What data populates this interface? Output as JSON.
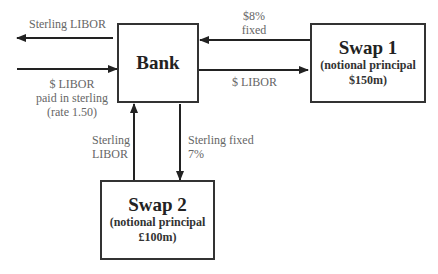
{
  "nodes": {
    "bank": {
      "title": "Bank"
    },
    "swap1": {
      "title": "Swap 1",
      "line1": "(notional principal",
      "line2": "$150m)"
    },
    "swap2": {
      "title": "Swap 2",
      "line1": "(notional principal",
      "line2": "£100m)"
    }
  },
  "edges": {
    "bank_out_left": {
      "line1": "Sterling LIBOR"
    },
    "in_bank_left": {
      "line1": "$ LIBOR",
      "line2": "paid in sterling",
      "line3": "(rate 1.50)"
    },
    "swap1_to_bank": {
      "line1": "$8%",
      "line2": "fixed"
    },
    "bank_to_swap1": {
      "line1": "$ LIBOR"
    },
    "swap2_to_bank": {
      "line1": "Sterling",
      "line2": "LIBOR"
    },
    "bank_to_swap2": {
      "line1": "Sterling fixed",
      "line2": "7%"
    }
  }
}
